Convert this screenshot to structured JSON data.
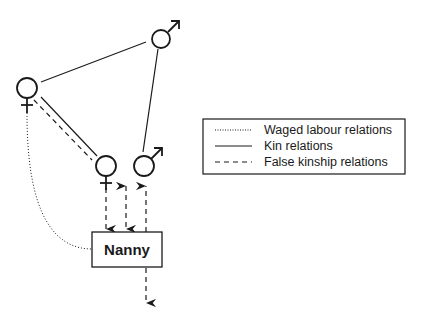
{
  "diagram": {
    "nodes": [
      {
        "id": "male-top",
        "symbol": "male",
        "label": "♂"
      },
      {
        "id": "female-left",
        "symbol": "female",
        "label": "♀"
      },
      {
        "id": "female-middle",
        "symbol": "female",
        "label": "♀"
      },
      {
        "id": "male-middle",
        "symbol": "male",
        "label": "♂"
      },
      {
        "id": "nanny",
        "symbol": "box",
        "label": "Nanny"
      }
    ],
    "edges": [
      {
        "from": "female-left",
        "to": "male-top",
        "type": "kin",
        "style": "solid"
      },
      {
        "from": "male-top",
        "to": "male-middle",
        "type": "kin",
        "style": "solid"
      },
      {
        "from": "female-left",
        "to": "female-middle",
        "type": "kin",
        "style": "solid"
      },
      {
        "from": "female-left",
        "to": "female-middle",
        "type": "false-kinship",
        "style": "dashed"
      },
      {
        "from": "female-left",
        "to": "nanny",
        "type": "waged-labour",
        "style": "dotted"
      },
      {
        "from": "female-middle",
        "to": "nanny",
        "type": "false-kinship",
        "style": "dashed",
        "arrow": "to-nanny"
      },
      {
        "from": "nanny",
        "to": "female-middle-area",
        "type": "false-kinship",
        "style": "dashed",
        "arrow": "both"
      },
      {
        "from": "nanny",
        "to": "male-middle",
        "type": "false-kinship",
        "style": "dashed",
        "arrow": "to-male"
      },
      {
        "from": "nanny",
        "to": "below",
        "type": "false-kinship",
        "style": "dashed",
        "arrow": "down"
      }
    ]
  },
  "legend": {
    "items": [
      {
        "style": "dotted",
        "label": "Waged labour relations"
      },
      {
        "style": "solid",
        "label": "Kin relations"
      },
      {
        "style": "dashed",
        "label": "False kinship relations"
      }
    ]
  },
  "colors": {
    "ink": "#1a1a1a",
    "background": "#ffffff"
  }
}
